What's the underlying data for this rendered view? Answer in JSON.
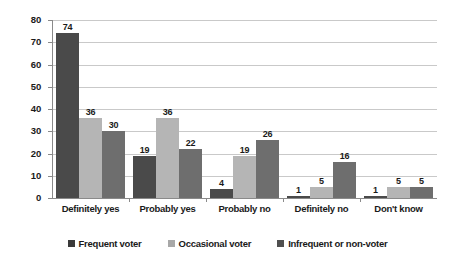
{
  "chart_data": {
    "type": "bar",
    "title": "",
    "xlabel": "",
    "ylabel": "",
    "ylim": [
      0,
      80
    ],
    "ytick_step": 10,
    "yticks": [
      0,
      10,
      20,
      30,
      40,
      50,
      60,
      70,
      80
    ],
    "grid": true,
    "legend_position": "bottom",
    "categories": [
      "Definitely yes",
      "Probably yes",
      "Probably no",
      "Definitely no",
      "Don't know"
    ],
    "series": [
      {
        "name": "Frequent voter",
        "color": "#4a4a4a",
        "values": [
          74,
          19,
          4,
          1,
          1
        ]
      },
      {
        "name": "Occasional voter",
        "color": "#b5b5b5",
        "values": [
          36,
          36,
          19,
          5,
          5
        ]
      },
      {
        "name": "Infrequent or non-voter",
        "color": "#6e6e6e",
        "values": [
          30,
          22,
          26,
          16,
          5
        ]
      }
    ]
  },
  "colors": {
    "background": "#ffffff",
    "gridline": "#c9c9c9",
    "axis": "#8a8a8a",
    "text": "#1a1a1a",
    "series_frequent": "#4a4a4a",
    "series_occasional": "#b5b5b5",
    "series_infrequent": "#6e6e6e"
  }
}
